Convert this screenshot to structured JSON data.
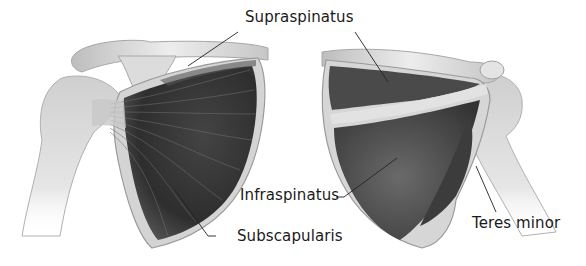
{
  "figure": {
    "views": [
      {
        "name": "anterior-view",
        "muscles": [
          "Supraspinatus",
          "Subscapularis"
        ]
      },
      {
        "name": "posterior-view",
        "muscles": [
          "Supraspinatus",
          "Infraspinatus",
          "Teres minor"
        ]
      }
    ],
    "labels": {
      "supraspinatus": "Supraspinatus",
      "infraspinatus": "Infraspinatus",
      "subscapularis": "Subscapularis",
      "teres_minor": "Teres minor"
    },
    "colors": {
      "background": "#ffffff",
      "bone": "#d9d9d9",
      "bone_highlight": "#f2f2f2",
      "muscle_dark": "#3a3a3a",
      "muscle_mid": "#5e5e5e",
      "leader_line": "#222222",
      "text": "#1a1a1a"
    }
  }
}
